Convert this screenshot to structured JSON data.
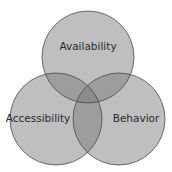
{
  "diagram": {
    "type": "venn",
    "sets": [
      {
        "id": "availability",
        "label": "Availability",
        "cx": 88,
        "cy": 57,
        "r": 46,
        "label_x": 88,
        "label_y": 47
      },
      {
        "id": "accessibility",
        "label": "Accessibility",
        "cx": 56,
        "cy": 119,
        "r": 46,
        "label_x": 38,
        "label_y": 119
      },
      {
        "id": "behavior",
        "label": "Behavior",
        "cx": 119,
        "cy": 119,
        "r": 46,
        "label_x": 136,
        "label_y": 119
      }
    ],
    "colors": {
      "single": "#bdbdbd",
      "double": "#8f8f8f",
      "triple": "#5e5e5e",
      "stroke": "#4a4a4a",
      "text": "#2a2a2a",
      "background": "#ffffff"
    }
  }
}
